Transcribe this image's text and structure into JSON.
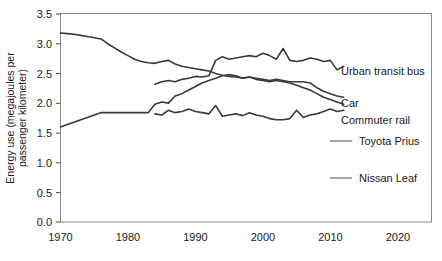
{
  "chart_data": {
    "type": "line",
    "title": "",
    "xlabel": "",
    "ylabel": "Energy use (megajoules per passenger kilometer)",
    "ylabel_line1": "Energy use (megajoules per",
    "ylabel_line2": "passenger kilometer)",
    "xlim": [
      1970,
      2025
    ],
    "ylim": [
      0.0,
      3.5
    ],
    "grid": false,
    "legend_position": "right-inline-at-line-ends",
    "xticks": [
      1970,
      1980,
      1990,
      2000,
      2010,
      2020
    ],
    "xtick_labels": [
      "1970",
      "1980",
      "1990",
      "2000",
      "2010",
      "2020"
    ],
    "yticks": [
      0.0,
      0.5,
      1.0,
      1.5,
      2.0,
      2.5,
      3.0,
      3.5
    ],
    "ytick_labels": [
      "0.0",
      "0.5",
      "1.0",
      "1.5",
      "2.0",
      "2.5",
      "3.0",
      "3.5"
    ],
    "series": [
      {
        "name": "Urban transit bus",
        "label": "Urban transit bus",
        "color": "#3a3a3a",
        "x": [
          1984,
          1985,
          1986,
          1987,
          1988,
          1989,
          1990,
          1991,
          1992,
          1993,
          1994,
          1995,
          1996,
          1997,
          1998,
          1999,
          2000,
          2001,
          2002,
          2003,
          2004,
          2005,
          2006,
          2007,
          2008,
          2009,
          2010,
          2011,
          2012
        ],
        "values": [
          2.32,
          2.36,
          2.38,
          2.36,
          2.4,
          2.42,
          2.45,
          2.44,
          2.46,
          2.72,
          2.78,
          2.74,
          2.76,
          2.78,
          2.8,
          2.78,
          2.84,
          2.8,
          2.74,
          2.92,
          2.72,
          2.7,
          2.72,
          2.76,
          2.74,
          2.7,
          2.72,
          2.56,
          2.62
        ]
      },
      {
        "name": "Car",
        "label": "Car",
        "color": "#3a3a3a",
        "x": [
          1970,
          1971,
          1972,
          1973,
          1974,
          1975,
          1976,
          1977,
          1978,
          1979,
          1980,
          1981,
          1982,
          1983,
          1984,
          1985,
          1986,
          1987,
          1988,
          1989,
          1990,
          1991,
          1992,
          1993,
          1994,
          1995,
          1996,
          1997,
          1998,
          1999,
          2000,
          2001,
          2002,
          2003,
          2004,
          2005,
          2006,
          2007,
          2008,
          2009,
          2010,
          2011,
          2012
        ],
        "values": [
          3.18,
          3.17,
          3.16,
          3.14,
          3.12,
          3.1,
          3.08,
          3.0,
          2.93,
          2.86,
          2.8,
          2.74,
          2.7,
          2.68,
          2.67,
          2.7,
          2.72,
          2.66,
          2.62,
          2.6,
          2.58,
          2.56,
          2.54,
          2.5,
          2.47,
          2.45,
          2.44,
          2.42,
          2.44,
          2.42,
          2.4,
          2.38,
          2.4,
          2.38,
          2.36,
          2.36,
          2.36,
          2.34,
          2.26,
          2.2,
          2.16,
          2.12,
          2.1
        ]
      },
      {
        "name": "Commuter rail",
        "label": "Commuter rail",
        "color": "#3a3a3a",
        "x": [
          1970,
          1971,
          1972,
          1973,
          1974,
          1975,
          1976,
          1977,
          1978,
          1979,
          1980,
          1981,
          1982,
          1983,
          1984,
          1985,
          1986,
          1987,
          1988,
          1989,
          1990,
          1991,
          1992,
          1993,
          1994,
          1995,
          1996,
          1997,
          1998,
          1999,
          2000,
          2001,
          2002,
          2003,
          2004,
          2005,
          2006,
          2007,
          2008,
          2009,
          2010,
          2011,
          2012
        ],
        "values": [
          1.6,
          1.64,
          1.68,
          1.72,
          1.76,
          1.8,
          1.84,
          1.84,
          1.84,
          1.84,
          1.84,
          1.84,
          1.84,
          1.84,
          1.98,
          2.02,
          2.0,
          2.12,
          2.16,
          2.22,
          2.28,
          2.34,
          2.38,
          2.42,
          2.46,
          2.48,
          2.46,
          2.42,
          2.44,
          2.4,
          2.38,
          2.36,
          2.38,
          2.36,
          2.34,
          2.3,
          2.26,
          2.22,
          2.16,
          2.1,
          2.06,
          2.02,
          1.98
        ]
      },
      {
        "name": "Commuter rail detail",
        "label": "",
        "color": "#3a3a3a",
        "x": [
          1984,
          1985,
          1986,
          1987,
          1988,
          1989,
          1990,
          1991,
          1992,
          1993,
          1994,
          1995,
          1996,
          1997,
          1998,
          1999,
          2000,
          2001,
          2002,
          2003,
          2004,
          2005,
          2006,
          2007,
          2008,
          2009,
          2010,
          2011,
          2012
        ],
        "values": [
          1.82,
          1.8,
          1.88,
          1.84,
          1.86,
          1.9,
          1.86,
          1.84,
          1.82,
          1.96,
          1.78,
          1.8,
          1.82,
          1.79,
          1.84,
          1.8,
          1.78,
          1.74,
          1.72,
          1.72,
          1.74,
          1.88,
          1.76,
          1.8,
          1.82,
          1.86,
          1.9,
          1.86,
          1.88
        ]
      }
    ],
    "legend_entries": [
      {
        "label": "Urban transit bus",
        "has_stub": false
      },
      {
        "label": "Car",
        "has_stub": false
      },
      {
        "label": "Commuter rail",
        "has_stub": false
      },
      {
        "label": "Toyota Prius",
        "has_stub": true
      },
      {
        "label": "Nissan Leaf",
        "has_stub": true
      }
    ]
  }
}
